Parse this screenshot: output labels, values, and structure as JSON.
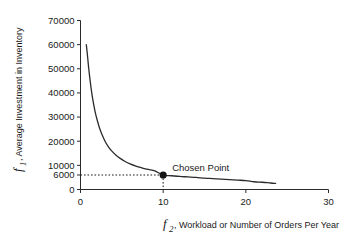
{
  "chart_data": {
    "type": "line",
    "title": "",
    "xlabel_parts": {
      "variable": "f",
      "subscript": "2",
      "rest": ", Workload or Number of Orders Per Year"
    },
    "ylabel_parts": {
      "variable": "f",
      "subscript": "1",
      "rest": ", Average Investment in Inventory"
    },
    "xlabel": "f2, Workload or Number of Orders Per Year",
    "ylabel": "f1, Average Investment in Inventory",
    "xlim": [
      0,
      30
    ],
    "ylim": [
      0,
      70000
    ],
    "grid": false,
    "legend": "none",
    "xticks": [
      0,
      10,
      20,
      30
    ],
    "xticklabels": [
      "0",
      "10",
      "20",
      "30"
    ],
    "yticks": [
      0,
      6000,
      10000,
      20000,
      30000,
      40000,
      50000,
      60000,
      70000
    ],
    "yticklabels": [
      "0",
      "6000",
      "10000",
      "20000",
      "30000",
      "40000",
      "50000",
      "60000",
      "70000"
    ],
    "series": [
      {
        "name": "Average Investment in Inventory",
        "color": "#2b2b2b",
        "x": [
          0.7,
          0.8,
          0.9,
          1.0,
          1.15,
          1.3,
          1.5,
          1.75,
          2.0,
          2.3,
          2.6,
          3.0,
          3.4,
          3.8,
          4.3,
          4.8,
          5.4,
          6.0,
          6.7,
          7.4,
          8.2,
          9.0,
          10.0,
          11.0,
          12.0,
          13.0,
          14.0,
          15.0,
          16.0,
          17.0,
          18.0,
          19.0,
          20.0,
          21.0,
          22.0,
          23.0,
          23.6
        ],
        "y": [
          60000,
          57000,
          53500,
          50000,
          45500,
          41500,
          37000,
          32500,
          29000,
          25500,
          22800,
          19800,
          17600,
          15900,
          14200,
          12900,
          11600,
          10600,
          9700,
          9000,
          8300,
          7700,
          6000,
          5700,
          5400,
          5200,
          5000,
          4700,
          4500,
          4300,
          4100,
          3900,
          3700,
          3200,
          3000,
          2700,
          2550
        ]
      }
    ],
    "annotations": [
      {
        "label": "Chosen Point",
        "x": 10,
        "y": 6000,
        "marker": "filled-circle",
        "leader_to_yaxis": true,
        "leader_to_xaxis": true
      }
    ]
  }
}
